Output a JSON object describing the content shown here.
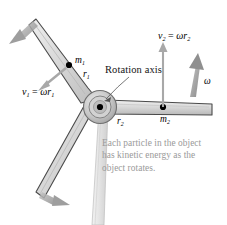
{
  "figure": {
    "axis_label": "Rotation axis",
    "caption_lines": [
      "Each particle in the object",
      "has kinetic energy as the",
      "object rotates."
    ],
    "caption_color": "#9a9a9a"
  },
  "labels": {
    "v1": {
      "symbol": "v",
      "sub": "1",
      "equals": " = ",
      "omega": "ω",
      "r": "r",
      "rsub": "1"
    },
    "v2": {
      "symbol": "v",
      "sub": "2",
      "equals": " = ",
      "omega": "ω",
      "r": "r",
      "rsub": "2"
    },
    "m1": {
      "symbol": "m",
      "sub": "1"
    },
    "m2": {
      "symbol": "m",
      "sub": "2"
    },
    "r1": {
      "symbol": "r",
      "sub": "1"
    },
    "r2": {
      "symbol": "r",
      "sub": "2"
    },
    "omega": {
      "symbol": "ω"
    }
  },
  "colors": {
    "blade_fill": "#d2d2d2",
    "blade_edge": "#4a4a4a",
    "hub_outer": "#b8b8b8",
    "hub_inner": "#d8d8d8",
    "tower": "#e2e2e2",
    "motion_arrow": "#9e9e9e",
    "vector_arrow": "#a8a8a8",
    "particle": "#000000",
    "leader_line": "#555555"
  },
  "elements": {
    "blade_upper_left": "blade-upper-left",
    "blade_lower_left": "blade-lower-left",
    "blade_right": "blade-right",
    "hub": "rotor-hub",
    "tower": "tower-pole",
    "particle_m1": "particle-m1",
    "particle_m2": "particle-m2",
    "velocity_vector_v1": "velocity-vector-v1",
    "velocity_vector_v2": "velocity-vector-v2",
    "omega_arrow": "angular-velocity-arrow",
    "motion_arrow_top": "motion-arrow-top-left",
    "motion_arrow_bottom": "motion-arrow-bottom-left",
    "leader": "rotation-axis-leader-line"
  }
}
